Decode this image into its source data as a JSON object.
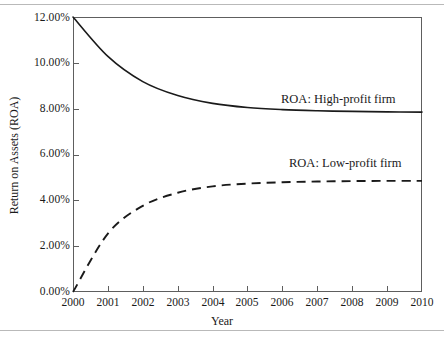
{
  "chart_data": {
    "type": "line",
    "title": "",
    "xlabel": "Year",
    "ylabel": "Return on Assets (ROA)",
    "x": [
      2000,
      2001,
      2002,
      2003,
      2004,
      2005,
      2006,
      2007,
      2008,
      2009,
      2010
    ],
    "xlim": [
      2000,
      2010
    ],
    "ylim": [
      0.0,
      12.0
    ],
    "yticks": [
      0.0,
      2.0,
      4.0,
      6.0,
      8.0,
      10.0,
      12.0
    ],
    "ytick_labels": [
      "0.00%",
      "2.00%",
      "4.00%",
      "6.00%",
      "8.00%",
      "10.00%",
      "12.00%"
    ],
    "xtick_labels": [
      "2000",
      "2001",
      "2002",
      "2003",
      "2004",
      "2005",
      "2006",
      "2007",
      "2008",
      "2009",
      "2010"
    ],
    "grid": false,
    "legend_position": "inline-annotation",
    "series": [
      {
        "name": "ROA: High-profit firm",
        "style": "solid",
        "color": "#1a1a1a",
        "values": [
          12.0,
          10.28,
          9.18,
          8.57,
          8.23,
          8.05,
          7.96,
          7.91,
          7.88,
          7.86,
          7.85
        ]
      },
      {
        "name": "ROA: Low-profit firm",
        "style": "dashed",
        "color": "#1a1a1a",
        "values": [
          0.0,
          2.55,
          3.76,
          4.33,
          4.61,
          4.73,
          4.79,
          4.82,
          4.84,
          4.85,
          4.85
        ]
      }
    ],
    "annotations": [
      {
        "text": "ROA: High-profit firm",
        "series": "ROA: High-profit firm"
      },
      {
        "text": "ROA: Low-profit firm",
        "series": "ROA: Low-profit firm"
      }
    ]
  },
  "axis": {
    "x_title": "Year",
    "y_title": "Return on Assets (ROA)"
  }
}
